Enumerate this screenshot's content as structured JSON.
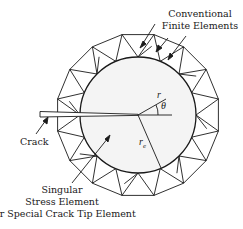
{
  "figure": {
    "labels": {
      "conventional_line1": "Conventional",
      "conventional_line2": "Finite Elements",
      "crack": "Crack",
      "singular_line1": "Singular",
      "singular_line2": "Stress Element",
      "singular_line3": "or Special Crack Tip Element"
    },
    "symbols": {
      "r": "r",
      "theta": "θ",
      "re_base": "r",
      "re_sub": "e"
    },
    "colors": {
      "stroke": "#1a1a1a",
      "inner_fill": "#f4f4f4",
      "background": "#ffffff"
    }
  }
}
